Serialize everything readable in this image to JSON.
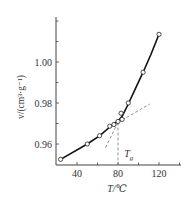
{
  "chart_data": {
    "type": "line",
    "title": "",
    "xlabel": "T/℃",
    "ylabel": "v/(cm³·g⁻¹)",
    "xlim": [
      20,
      140
    ],
    "ylim": [
      0.95,
      1.018
    ],
    "x_ticks": [
      40,
      80,
      120
    ],
    "x_minor_ticks": [
      60,
      100,
      140
    ],
    "y_ticks": [
      0.96,
      0.98,
      1.0
    ],
    "y_tick_labels": [
      "0.96",
      "0.98",
      "1.00"
    ],
    "y_minor_ticks": [
      0.97,
      0.99,
      1.01
    ],
    "grid": false,
    "legend": null,
    "series": [
      {
        "name": "specific volume",
        "marker": "open-circle",
        "x": [
          24,
          50,
          62,
          72,
          76,
          80,
          83,
          84,
          90,
          104.5,
          120
        ],
        "values": [
          0.9525,
          0.96,
          0.964,
          0.9687,
          0.9695,
          0.971,
          0.975,
          0.972,
          0.98,
          0.995,
          1.0135
        ]
      }
    ],
    "annotations": [
      {
        "type": "dashed-extrapolation",
        "label": "glassy-line extension",
        "from": [
          80,
          0.9705
        ],
        "to": [
          111,
          0.9795
        ]
      },
      {
        "type": "dashed-extrapolation",
        "label": "rubbery-line extension",
        "from": [
          80,
          0.9705
        ],
        "to": [
          67,
          0.9575
        ]
      },
      {
        "type": "dashed-vertical",
        "label": "Tg marker",
        "x": 80,
        "from_y": 0.9705,
        "to_y": 0.95
      },
      {
        "type": "text",
        "text": "T",
        "subscript": "g",
        "x": 86,
        "y": 0.9555
      }
    ]
  }
}
